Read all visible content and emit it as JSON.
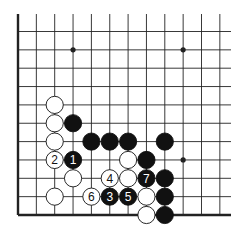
{
  "board": {
    "description": "Go board corner diagram (lower-left corner)",
    "columns": 12,
    "rows": 11,
    "edges": [
      "left",
      "bottom"
    ],
    "star_points": [
      [
        3,
        1
      ],
      [
        9,
        1
      ],
      [
        9,
        7
      ],
      [
        3,
        7
      ]
    ],
    "colors": {
      "black": "#111111",
      "white": "#ffffff",
      "line": "#222222"
    }
  },
  "stones": [
    {
      "color": "white",
      "col": 2,
      "row": 4,
      "label": ""
    },
    {
      "color": "white",
      "col": 2,
      "row": 5,
      "label": ""
    },
    {
      "color": "black",
      "col": 3,
      "row": 5,
      "label": ""
    },
    {
      "color": "white",
      "col": 2,
      "row": 6,
      "label": ""
    },
    {
      "color": "black",
      "col": 4,
      "row": 6,
      "label": ""
    },
    {
      "color": "black",
      "col": 5,
      "row": 6,
      "label": ""
    },
    {
      "color": "black",
      "col": 6,
      "row": 6,
      "label": ""
    },
    {
      "color": "black",
      "col": 8,
      "row": 6,
      "label": ""
    },
    {
      "color": "white",
      "col": 2,
      "row": 7,
      "label": "2"
    },
    {
      "color": "black",
      "col": 3,
      "row": 7,
      "label": "1"
    },
    {
      "color": "white",
      "col": 6,
      "row": 7,
      "label": ""
    },
    {
      "color": "black",
      "col": 7,
      "row": 7,
      "label": ""
    },
    {
      "color": "white",
      "col": 3,
      "row": 8,
      "label": ""
    },
    {
      "color": "white",
      "col": 5,
      "row": 8,
      "label": "4"
    },
    {
      "color": "white",
      "col": 6,
      "row": 8,
      "label": ""
    },
    {
      "color": "black",
      "col": 7,
      "row": 8,
      "label": "7"
    },
    {
      "color": "black",
      "col": 8,
      "row": 8,
      "label": ""
    },
    {
      "color": "white",
      "col": 2,
      "row": 9,
      "label": ""
    },
    {
      "color": "white",
      "col": 4,
      "row": 9,
      "label": "6"
    },
    {
      "color": "black",
      "col": 5,
      "row": 9,
      "label": "3"
    },
    {
      "color": "black",
      "col": 6,
      "row": 9,
      "label": "5"
    },
    {
      "color": "white",
      "col": 7,
      "row": 9,
      "label": ""
    },
    {
      "color": "black",
      "col": 8,
      "row": 9,
      "label": ""
    },
    {
      "color": "white",
      "col": 7,
      "row": 10,
      "label": ""
    },
    {
      "color": "black",
      "col": 8,
      "row": 10,
      "label": ""
    }
  ]
}
